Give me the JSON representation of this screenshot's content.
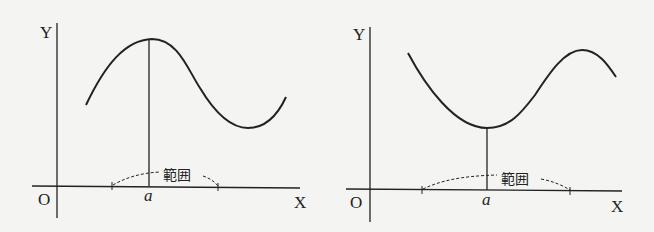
{
  "figures": [
    {
      "id": "left",
      "description": "Curve with a local maximum at x = a; vertical line from maximum to X-axis; dashed arrows indicate range (範囲) around a",
      "axis_labels": {
        "y": "Y",
        "x": "X",
        "origin": "O"
      },
      "point_label": "a",
      "range_label": "範囲",
      "extremum": "maximum"
    },
    {
      "id": "right",
      "description": "Curve with a local minimum at x = a; vertical line from minimum to X-axis; dashed arrows indicate range (範囲) around a",
      "axis_labels": {
        "y": "Y",
        "x": "X",
        "origin": "O"
      },
      "point_label": "a",
      "range_label": "範囲",
      "extremum": "minimum"
    }
  ],
  "colors": {
    "ink": "#222222",
    "background": "#f4f4f2"
  }
}
